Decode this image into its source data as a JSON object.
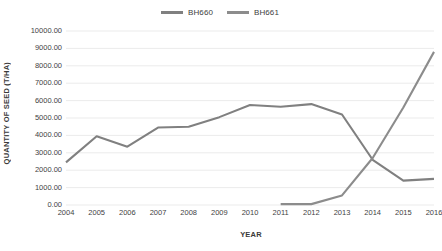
{
  "chart_data": {
    "type": "line",
    "title": "",
    "xlabel": "YEAR",
    "ylabel": "QUANTITY OF SEED (T/HA)",
    "categories": [
      "2004",
      "2005",
      "2006",
      "2007",
      "2008",
      "2009",
      "2010",
      "2011",
      "2012",
      "2013",
      "2014",
      "2015",
      "2016"
    ],
    "x": [
      2004,
      2005,
      2006,
      2007,
      2008,
      2009,
      2010,
      2011,
      2012,
      2013,
      2014,
      2015,
      2016
    ],
    "ylim": [
      0,
      10000
    ],
    "ytick_step": 1000,
    "ytick_labels": [
      "10000.00",
      "9000.00",
      "8000.00",
      "7000.00",
      "6000.00",
      "5000.00",
      "4000.00",
      "3000.00",
      "2000.00",
      "1000.00",
      "0.00"
    ],
    "ytick_values": [
      10000,
      9000,
      8000,
      7000,
      6000,
      5000,
      4000,
      3000,
      2000,
      1000,
      0
    ],
    "grid": true,
    "grid_axis": "y",
    "legend_position": "top-center",
    "series": [
      {
        "name": "BH660",
        "color": "#808080",
        "x": [
          2004,
          2005,
          2006,
          2007,
          2008,
          2009,
          2010,
          2011,
          2012,
          2013,
          2014,
          2015,
          2016
        ],
        "values": [
          2450,
          3950,
          3350,
          4450,
          4500,
          5050,
          5750,
          5650,
          5800,
          5200,
          2600,
          1400,
          1500
        ]
      },
      {
        "name": "BH661",
        "color": "#8c8c8c",
        "x": [
          2011,
          2012,
          2013,
          2014,
          2015,
          2016
        ],
        "values": [
          50,
          50,
          550,
          2700,
          5600,
          8800
        ]
      }
    ]
  },
  "legend": {
    "entries": [
      {
        "label": "BH660",
        "color": "#808080"
      },
      {
        "label": "BH661",
        "color": "#8c8c8c"
      }
    ]
  },
  "axes": {
    "x_title": "YEAR",
    "y_title": "QUANTITY OF SEED (T/HA)"
  },
  "colors": {
    "background": "#ffffff",
    "gridline": "#e2e2e2",
    "text": "#3f3f3f",
    "series_1": "#808080",
    "series_2": "#8c8c8c"
  }
}
